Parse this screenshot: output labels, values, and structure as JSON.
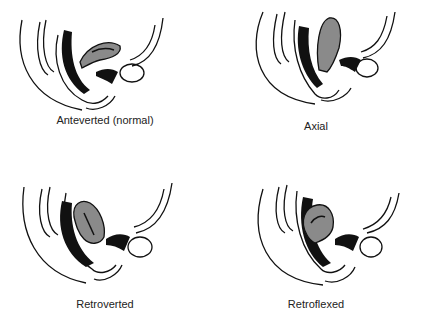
{
  "figure": {
    "colors": {
      "uterus_fill": "#8a8a8a",
      "line": "#111111",
      "background": "#ffffff"
    },
    "panels": [
      {
        "label": "Anteverted (normal)",
        "position": "top-left"
      },
      {
        "label": "Axial",
        "position": "top-right"
      },
      {
        "label": "Retroverted",
        "position": "bottom-left"
      },
      {
        "label": "Retroflexed",
        "position": "bottom-right"
      }
    ]
  }
}
